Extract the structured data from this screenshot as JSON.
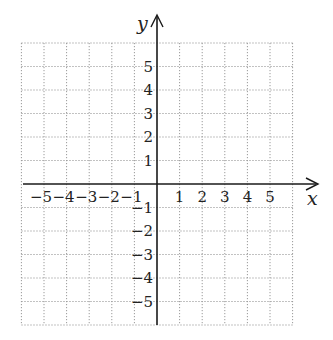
{
  "chart_data": {
    "type": "scatter",
    "title": "",
    "xlabel": "x",
    "ylabel": "y",
    "xlim": [
      -6,
      6
    ],
    "ylim": [
      -6,
      6
    ],
    "grid": true,
    "grid_style": "dotted",
    "x_tick_labels": [
      "-5",
      "-4",
      "-3",
      "-2",
      "-1",
      "1",
      "2",
      "3",
      "4",
      "5"
    ],
    "y_tick_labels": [
      "5",
      "4",
      "3",
      "2",
      "1",
      "-1",
      "-2",
      "-3",
      "-4",
      "-5"
    ],
    "series": [],
    "legend": null
  },
  "labels": {
    "x_axis": "x",
    "y_axis": "y"
  },
  "colors": {
    "axis": "#1a1a1a",
    "grid": "#9a9a9a",
    "text": "#222222"
  }
}
